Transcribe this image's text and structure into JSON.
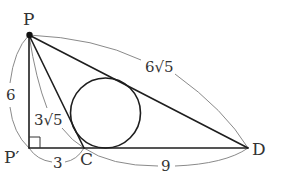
{
  "figure": {
    "type": "geometry",
    "colors": {
      "edge": "#1e1e1e",
      "dimension_arc": "#8a8a8a",
      "label": "#333333",
      "background": "#ffffff"
    }
  },
  "points": {
    "P": {
      "label": "P"
    },
    "P_prime": {
      "label": "P′"
    },
    "C": {
      "label": "C"
    },
    "D": {
      "label": "D"
    }
  },
  "lengths": {
    "PP_prime": "6",
    "PC": "3√5",
    "PD": "6√5",
    "P_primeC": "3",
    "CD": "9"
  },
  "marks": {
    "right_angle_at": "P′",
    "incircle": "triangle PCD"
  }
}
